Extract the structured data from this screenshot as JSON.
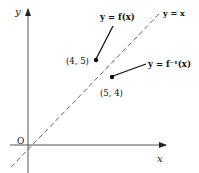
{
  "diagram": {
    "type": "function-inverse-reflection",
    "axes": {
      "x_label": "x",
      "y_label": "y",
      "origin_label": "O"
    },
    "lines": {
      "identity": {
        "label": "y = x",
        "style": "dashed"
      }
    },
    "curves": [
      {
        "label": "y = f(x)",
        "point_label": "(4, 5)"
      },
      {
        "label": "y = f⁻¹(x)",
        "point_label": "(5, 4)"
      }
    ]
  }
}
